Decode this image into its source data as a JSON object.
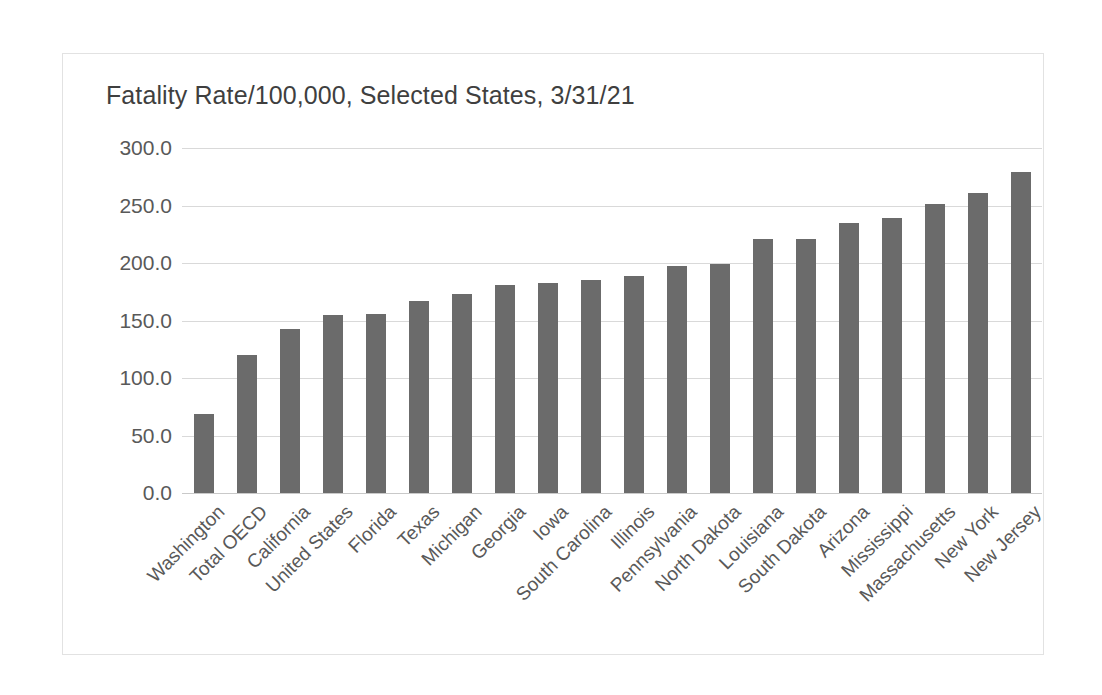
{
  "chart_data": {
    "type": "bar",
    "title": "Fatality Rate/100,000, Selected States, 3/31/21",
    "xlabel": "",
    "ylabel": "",
    "ylim": [
      0,
      300
    ],
    "ytick_labels": [
      "300.0",
      "250.0",
      "200.0",
      "150.0",
      "100.0",
      "50.0",
      "0.0"
    ],
    "ytick_values": [
      300,
      250,
      200,
      150,
      100,
      50,
      0
    ],
    "grid": true,
    "legend": "none",
    "bar_color": "#6b6b6b",
    "categories": [
      "Washington",
      "Total OECD",
      "California",
      "United States",
      "Florida",
      "Texas",
      "Michigan",
      "Georgia",
      "Iowa",
      "South Carolina",
      "Illinois",
      "Pennsylvania",
      "North Dakota",
      "Louisiana",
      "South Dakota",
      "Arizona",
      "Mississippi",
      "Massachusetts",
      "New York",
      "New Jersey"
    ],
    "values": [
      68.7,
      120.4,
      142.6,
      154.8,
      155.9,
      167.2,
      172.8,
      180.9,
      182.3,
      185.1,
      188.5,
      197.7,
      199.3,
      220.8,
      221.2,
      235.2,
      239.0,
      251.6,
      261.2,
      279.3
    ]
  },
  "frame": {
    "border_color": "#e2e2e2",
    "background": "#ffffff"
  }
}
